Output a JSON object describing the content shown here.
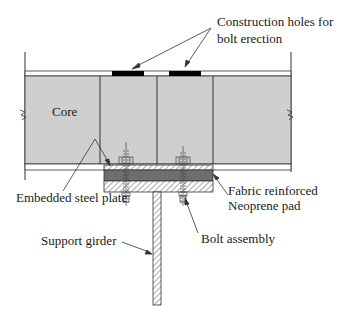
{
  "diagram": {
    "labels": {
      "construction_holes_line1": "Construction holes for",
      "construction_holes_line2": "bolt erection",
      "core": "Core",
      "embedded_plate": "Embedded steel plate",
      "neoprene_line1": "Fabric reinforced",
      "neoprene_line2": "Neoprene pad",
      "support_girder": "Support girder",
      "bolt_assembly": "Bolt assembly"
    },
    "colors": {
      "core_fill": "#cfcfcf",
      "neoprene_fill": "#6e6e6e",
      "hole_fill": "#000000",
      "line": "#333333"
    }
  }
}
